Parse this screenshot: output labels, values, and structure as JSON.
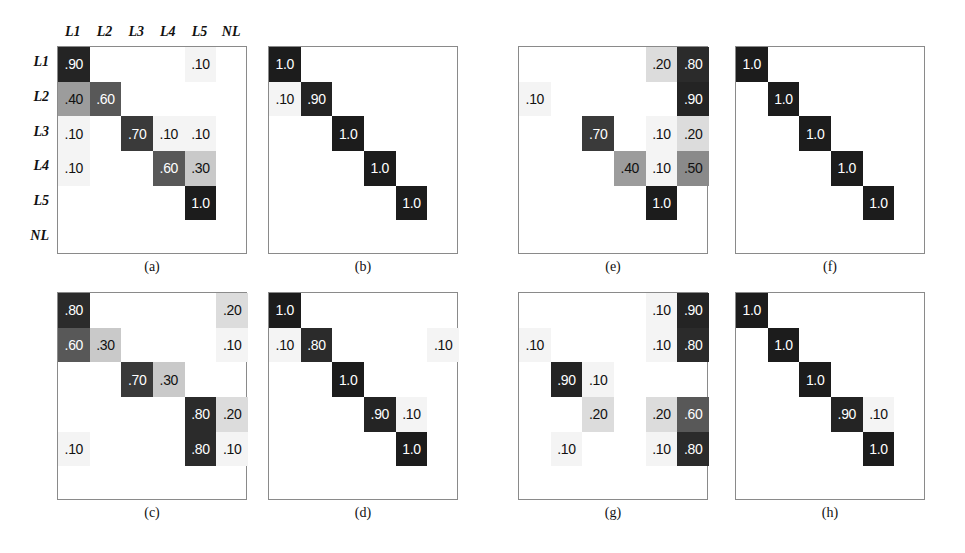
{
  "figure": {
    "labels": [
      "L1",
      "L2",
      "L3",
      "L4",
      "L5",
      "NL"
    ],
    "axis_labels_shown_on": "a",
    "n_rows": 6,
    "n_cols": 6
  },
  "chart_data": {
    "type": "heatmap",
    "title": "",
    "xlabel": "",
    "ylabel": "",
    "categories_x": [
      "L1",
      "L2",
      "L3",
      "L4",
      "L5",
      "NL"
    ],
    "categories_y": [
      "L1",
      "L2",
      "L3",
      "L4",
      "L5",
      "NL"
    ],
    "grid": false,
    "legend": "none",
    "value_range": [
      0.0,
      1.0
    ],
    "colormap": "grayscale-inverted",
    "panels": [
      {
        "id": "a",
        "caption": "(a)",
        "show_axis_labels": true,
        "cells": [
          {
            "row": 0,
            "col": 0,
            "text": ".90",
            "value": 0.9
          },
          {
            "row": 0,
            "col": 4,
            "text": ".10",
            "value": 0.1
          },
          {
            "row": 1,
            "col": 0,
            "text": ".40",
            "value": 0.4
          },
          {
            "row": 1,
            "col": 1,
            "text": ".60",
            "value": 0.6
          },
          {
            "row": 2,
            "col": 0,
            "text": ".10",
            "value": 0.1
          },
          {
            "row": 2,
            "col": 2,
            "text": ".70",
            "value": 0.7
          },
          {
            "row": 2,
            "col": 3,
            "text": ".10",
            "value": 0.1
          },
          {
            "row": 2,
            "col": 4,
            "text": ".10",
            "value": 0.1
          },
          {
            "row": 3,
            "col": 0,
            "text": ".10",
            "value": 0.1
          },
          {
            "row": 3,
            "col": 3,
            "text": ".60",
            "value": 0.6
          },
          {
            "row": 3,
            "col": 4,
            "text": ".30",
            "value": 0.3
          },
          {
            "row": 4,
            "col": 4,
            "text": "1.0",
            "value": 1.0
          }
        ]
      },
      {
        "id": "b",
        "caption": "(b)",
        "show_axis_labels": false,
        "cells": [
          {
            "row": 0,
            "col": 0,
            "text": "1.0",
            "value": 1.0
          },
          {
            "row": 1,
            "col": 0,
            "text": ".10",
            "value": 0.1
          },
          {
            "row": 1,
            "col": 1,
            "text": ".90",
            "value": 0.9
          },
          {
            "row": 2,
            "col": 2,
            "text": "1.0",
            "value": 1.0
          },
          {
            "row": 3,
            "col": 3,
            "text": "1.0",
            "value": 1.0
          },
          {
            "row": 4,
            "col": 4,
            "text": "1.0",
            "value": 1.0
          }
        ]
      },
      {
        "id": "e",
        "caption": "(e)",
        "show_axis_labels": false,
        "cells": [
          {
            "row": 0,
            "col": 4,
            "text": ".20",
            "value": 0.2
          },
          {
            "row": 0,
            "col": 5,
            "text": ".80",
            "value": 0.8
          },
          {
            "row": 1,
            "col": 0,
            "text": ".10",
            "value": 0.1
          },
          {
            "row": 1,
            "col": 5,
            "text": ".90",
            "value": 0.9
          },
          {
            "row": 2,
            "col": 2,
            "text": ".70",
            "value": 0.7
          },
          {
            "row": 2,
            "col": 4,
            "text": ".10",
            "value": 0.1
          },
          {
            "row": 2,
            "col": 5,
            "text": ".20",
            "value": 0.2
          },
          {
            "row": 3,
            "col": 3,
            "text": ".40",
            "value": 0.4
          },
          {
            "row": 3,
            "col": 4,
            "text": ".10",
            "value": 0.1
          },
          {
            "row": 3,
            "col": 5,
            "text": ".50",
            "value": 0.5
          },
          {
            "row": 4,
            "col": 4,
            "text": "1.0",
            "value": 1.0
          }
        ]
      },
      {
        "id": "f",
        "caption": "(f)",
        "show_axis_labels": false,
        "cells": [
          {
            "row": 0,
            "col": 0,
            "text": "1.0",
            "value": 1.0
          },
          {
            "row": 1,
            "col": 1,
            "text": "1.0",
            "value": 1.0
          },
          {
            "row": 2,
            "col": 2,
            "text": "1.0",
            "value": 1.0
          },
          {
            "row": 3,
            "col": 3,
            "text": "1.0",
            "value": 1.0
          },
          {
            "row": 4,
            "col": 4,
            "text": "1.0",
            "value": 1.0
          }
        ]
      },
      {
        "id": "c",
        "caption": "(c)",
        "show_axis_labels": false,
        "cells": [
          {
            "row": 0,
            "col": 0,
            "text": ".80",
            "value": 0.8
          },
          {
            "row": 0,
            "col": 5,
            "text": ".20",
            "value": 0.2
          },
          {
            "row": 1,
            "col": 0,
            "text": ".60",
            "value": 0.6
          },
          {
            "row": 1,
            "col": 1,
            "text": ".30",
            "value": 0.3
          },
          {
            "row": 1,
            "col": 5,
            "text": ".10",
            "value": 0.1
          },
          {
            "row": 2,
            "col": 2,
            "text": ".70",
            "value": 0.7
          },
          {
            "row": 2,
            "col": 3,
            "text": ".30",
            "value": 0.3
          },
          {
            "row": 3,
            "col": 4,
            "text": ".80",
            "value": 0.8
          },
          {
            "row": 3,
            "col": 5,
            "text": ".20",
            "value": 0.2
          },
          {
            "row": 4,
            "col": 0,
            "text": ".10",
            "value": 0.1
          },
          {
            "row": 4,
            "col": 4,
            "text": ".80",
            "value": 0.8
          },
          {
            "row": 4,
            "col": 5,
            "text": ".10",
            "value": 0.1
          }
        ]
      },
      {
        "id": "d",
        "caption": "(d)",
        "show_axis_labels": false,
        "cells": [
          {
            "row": 0,
            "col": 0,
            "text": "1.0",
            "value": 1.0
          },
          {
            "row": 1,
            "col": 0,
            "text": ".10",
            "value": 0.1
          },
          {
            "row": 1,
            "col": 1,
            "text": ".80",
            "value": 0.8
          },
          {
            "row": 1,
            "col": 5,
            "text": ".10",
            "value": 0.1
          },
          {
            "row": 2,
            "col": 2,
            "text": "1.0",
            "value": 1.0
          },
          {
            "row": 3,
            "col": 3,
            "text": ".90",
            "value": 0.9
          },
          {
            "row": 3,
            "col": 4,
            "text": ".10",
            "value": 0.1
          },
          {
            "row": 4,
            "col": 4,
            "text": "1.0",
            "value": 1.0
          }
        ]
      },
      {
        "id": "g",
        "caption": "(g)",
        "show_axis_labels": false,
        "cells": [
          {
            "row": 0,
            "col": 4,
            "text": ".10",
            "value": 0.1
          },
          {
            "row": 0,
            "col": 5,
            "text": ".90",
            "value": 0.9
          },
          {
            "row": 1,
            "col": 0,
            "text": ".10",
            "value": 0.1
          },
          {
            "row": 1,
            "col": 4,
            "text": ".10",
            "value": 0.1
          },
          {
            "row": 1,
            "col": 5,
            "text": ".80",
            "value": 0.8
          },
          {
            "row": 2,
            "col": 1,
            "text": ".90",
            "value": 0.9
          },
          {
            "row": 2,
            "col": 2,
            "text": ".10",
            "value": 0.1
          },
          {
            "row": 3,
            "col": 2,
            "text": ".20",
            "value": 0.2
          },
          {
            "row": 3,
            "col": 4,
            "text": ".20",
            "value": 0.2
          },
          {
            "row": 3,
            "col": 5,
            "text": ".60",
            "value": 0.6
          },
          {
            "row": 4,
            "col": 1,
            "text": ".10",
            "value": 0.1
          },
          {
            "row": 4,
            "col": 4,
            "text": ".10",
            "value": 0.1
          },
          {
            "row": 4,
            "col": 5,
            "text": ".80",
            "value": 0.8
          }
        ]
      },
      {
        "id": "h",
        "caption": "(h)",
        "show_axis_labels": false,
        "cells": [
          {
            "row": 0,
            "col": 0,
            "text": "1.0",
            "value": 1.0
          },
          {
            "row": 1,
            "col": 1,
            "text": "1.0",
            "value": 1.0
          },
          {
            "row": 2,
            "col": 2,
            "text": "1.0",
            "value": 1.0
          },
          {
            "row": 3,
            "col": 3,
            "text": ".90",
            "value": 0.9
          },
          {
            "row": 3,
            "col": 4,
            "text": ".10",
            "value": 0.1
          },
          {
            "row": 4,
            "col": 4,
            "text": "1.0",
            "value": 1.0
          }
        ]
      }
    ]
  },
  "layout": {
    "panel_positions": [
      {
        "id": "a",
        "box_x": 57,
        "box_y": 46,
        "box_w": 190,
        "box_h": 208,
        "caption_y": 259
      },
      {
        "id": "b",
        "box_x": 268,
        "box_y": 46,
        "box_w": 190,
        "box_h": 208,
        "caption_y": 259
      },
      {
        "id": "e",
        "box_x": 518,
        "box_y": 46,
        "box_w": 190,
        "box_h": 208,
        "caption_y": 259
      },
      {
        "id": "f",
        "box_x": 735,
        "box_y": 46,
        "box_w": 190,
        "box_h": 208,
        "caption_y": 259
      },
      {
        "id": "c",
        "box_x": 57,
        "box_y": 292,
        "box_w": 190,
        "box_h": 208,
        "caption_y": 505
      },
      {
        "id": "d",
        "box_x": 268,
        "box_y": 292,
        "box_w": 190,
        "box_h": 208,
        "caption_y": 505
      },
      {
        "id": "g",
        "box_x": 518,
        "box_y": 292,
        "box_w": 190,
        "box_h": 208,
        "caption_y": 505
      },
      {
        "id": "h",
        "box_x": 735,
        "box_y": 292,
        "box_w": 190,
        "box_h": 208,
        "caption_y": 505
      }
    ]
  }
}
